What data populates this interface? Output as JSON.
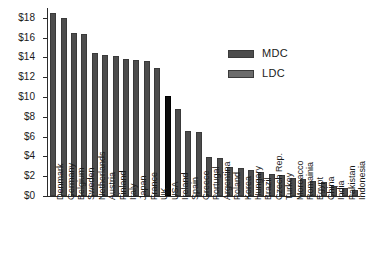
{
  "chart_data": {
    "type": "bar",
    "title": "",
    "subtitle": "",
    "xlabel": "",
    "ylabel": "",
    "ylim": [
      0,
      19
    ],
    "grid": false,
    "y_ticks": [
      "$0",
      "$2",
      "$4",
      "$6",
      "$8",
      "$10",
      "$12",
      "$14",
      "$16",
      "$18"
    ],
    "y_tick_values": [
      0,
      2,
      4,
      6,
      8,
      10,
      12,
      14,
      16,
      18
    ],
    "legend_position": "upper-right",
    "legend": [
      {
        "name": "MDC",
        "color": "#4d4d4d"
      },
      {
        "name": "LDC",
        "color": "#6b6b6b"
      }
    ],
    "highlight_color": "#0d0d0d",
    "bar_color": "#4d4d4d",
    "categories": [
      "Denmark",
      "Germany",
      "Belgium",
      "Sweden",
      "Netherlands",
      "Austria",
      "Finland",
      "Italy",
      "Japan",
      "France",
      "UK",
      "USA",
      "Ireland",
      "Spain",
      "Greece",
      "Portugal",
      "Argentina",
      "Poland",
      "Korea",
      "Hungary",
      "Brazil",
      "Czech Rep.",
      "Turkey",
      "Moroacco",
      "Romainia",
      "Egypt",
      "China",
      "India",
      "Pakistan",
      "Indonesia"
    ],
    "values": [
      18.5,
      18.0,
      16.5,
      16.4,
      14.5,
      14.3,
      14.2,
      13.8,
      13.7,
      13.6,
      12.9,
      10.1,
      8.8,
      6.6,
      6.5,
      3.9,
      3.8,
      2.9,
      2.8,
      2.6,
      2.4,
      2.2,
      2.1,
      1.8,
      1.7,
      1.5,
      1.4,
      1.0,
      0.8,
      0.6
    ],
    "highlighted": [
      "USA"
    ]
  }
}
